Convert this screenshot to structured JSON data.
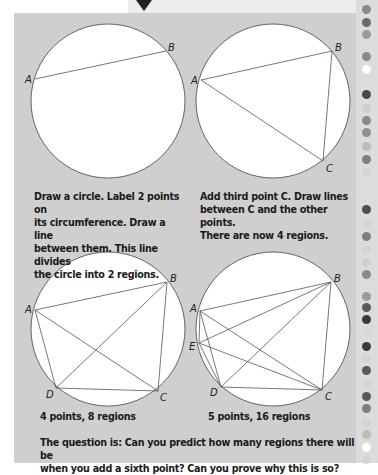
{
  "figures": [
    {
      "id": "fig1",
      "circle": {
        "cx": 108,
        "cy": 101,
        "r": 77
      },
      "points": [
        {
          "label": "A",
          "x": 35,
          "y": 79,
          "lx": 25,
          "ly": 83
        },
        {
          "label": "B",
          "x": 166,
          "y": 51,
          "lx": 168,
          "ly": 51
        }
      ],
      "lines": [
        [
          "A",
          "B"
        ]
      ],
      "caption": [
        "Draw a circle. Label 2 points on",
        "its circumference. Draw a line",
        "between them. This line divides",
        "the circle into 2 regions."
      ]
    },
    {
      "id": "fig2",
      "circle": {
        "cx": 273,
        "cy": 101,
        "r": 77
      },
      "points": [
        {
          "label": "A",
          "x": 201,
          "y": 80,
          "lx": 191,
          "ly": 84
        },
        {
          "label": "B",
          "x": 332,
          "y": 51,
          "lx": 335,
          "ly": 51
        },
        {
          "label": "C",
          "x": 323,
          "y": 161,
          "lx": 326,
          "ly": 172
        }
      ],
      "lines": [
        [
          "A",
          "B"
        ],
        [
          "A",
          "C"
        ],
        [
          "B",
          "C"
        ]
      ],
      "caption": [
        "Add third point C. Draw lines",
        "between C and the other points.",
        "There are now 4 regions."
      ]
    },
    {
      "id": "fig3",
      "circle": {
        "cx": 108,
        "cy": 329,
        "r": 77
      },
      "points": [
        {
          "label": "A",
          "x": 35,
          "y": 310,
          "lx": 25,
          "ly": 313
        },
        {
          "label": "B",
          "x": 167,
          "y": 282,
          "lx": 170,
          "ly": 282
        },
        {
          "label": "C",
          "x": 158,
          "y": 391,
          "lx": 160,
          "ly": 401
        },
        {
          "label": "D",
          "x": 56,
          "y": 388,
          "lx": 46,
          "ly": 398
        }
      ],
      "lines": [
        [
          "A",
          "B"
        ],
        [
          "A",
          "C"
        ],
        [
          "A",
          "D"
        ],
        [
          "B",
          "C"
        ],
        [
          "B",
          "D"
        ],
        [
          "C",
          "D"
        ]
      ],
      "caption": [
        "4 points, 8 regions"
      ]
    },
    {
      "id": "fig4",
      "circle": {
        "cx": 273,
        "cy": 329,
        "r": 77
      },
      "points": [
        {
          "label": "A",
          "x": 200,
          "y": 311,
          "lx": 190,
          "ly": 312
        },
        {
          "label": "B",
          "x": 331,
          "y": 282,
          "lx": 334,
          "ly": 282
        },
        {
          "label": "C",
          "x": 322,
          "y": 390,
          "lx": 325,
          "ly": 400
        },
        {
          "label": "D",
          "x": 221,
          "y": 387,
          "lx": 210,
          "ly": 396
        },
        {
          "label": "E",
          "x": 199,
          "y": 343,
          "lx": 189,
          "ly": 350
        }
      ],
      "lines": [
        [
          "A",
          "B"
        ],
        [
          "A",
          "C"
        ],
        [
          "A",
          "D"
        ],
        [
          "A",
          "E"
        ],
        [
          "B",
          "C"
        ],
        [
          "B",
          "D"
        ],
        [
          "B",
          "E"
        ],
        [
          "C",
          "D"
        ],
        [
          "C",
          "E"
        ],
        [
          "D",
          "E"
        ]
      ],
      "caption": [
        "5 points, 16 regions"
      ]
    }
  ],
  "question": [
    "The question is: Can you predict how many regions there will be",
    "when you add a sixth point? Can you prove why this is so?"
  ],
  "colors": {
    "panel": "#cfcfcf",
    "circle_fill": "#ffffff",
    "stroke": "#555555"
  },
  "rail_dots": [
    {
      "y": 5,
      "c": "#8a8a8a"
    },
    {
      "y": 18,
      "c": "#6a6a6a"
    },
    {
      "y": 30,
      "c": "#9a9a9a"
    },
    {
      "y": 52,
      "c": "#8a8a8a"
    },
    {
      "y": 65,
      "c": "#ffffff"
    },
    {
      "y": 90,
      "c": "#4a4a4a"
    },
    {
      "y": 104,
      "c": "#cfcfcf"
    },
    {
      "y": 116,
      "c": "#8a8a8a"
    },
    {
      "y": 128,
      "c": "#8f8f8f"
    },
    {
      "y": 142,
      "c": "#bdbdbd"
    },
    {
      "y": 155,
      "c": "#7f7f7f"
    },
    {
      "y": 168,
      "c": "#d4d4d4"
    },
    {
      "y": 205,
      "c": "#4f4f4f"
    },
    {
      "y": 219,
      "c": "#d4d4d4"
    },
    {
      "y": 232,
      "c": "#7f7f7f"
    },
    {
      "y": 245,
      "c": "#d4d4d4"
    },
    {
      "y": 258,
      "c": "#cfcfcf"
    },
    {
      "y": 270,
      "c": "#8a8a8a"
    },
    {
      "y": 292,
      "c": "#9a9a9a"
    },
    {
      "y": 303,
      "c": "#5a5a5a"
    },
    {
      "y": 315,
      "c": "#3a3a3a"
    },
    {
      "y": 328,
      "c": "#d8d8d8"
    },
    {
      "y": 342,
      "c": "#3a3a3a"
    },
    {
      "y": 354,
      "c": "#d4d4d4"
    },
    {
      "y": 366,
      "c": "#5a5a5a"
    },
    {
      "y": 379,
      "c": "#d4d4d4"
    },
    {
      "y": 392,
      "c": "#5a5a5a"
    },
    {
      "y": 404,
      "c": "#7f7f7f"
    },
    {
      "y": 418,
      "c": "#d4d4d4"
    },
    {
      "y": 430,
      "c": "#bdbdbd"
    },
    {
      "y": 443,
      "c": "#ffffff"
    },
    {
      "y": 455,
      "c": "#d4d4d4"
    }
  ]
}
